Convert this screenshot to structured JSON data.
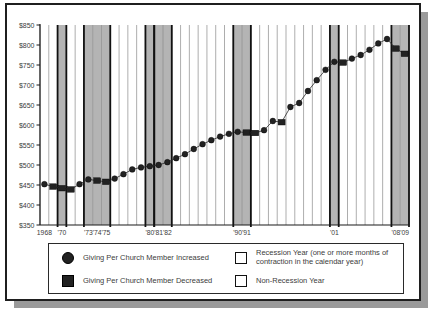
{
  "chart_data": {
    "type": "line",
    "title": "",
    "xlabel": "",
    "ylabel": "",
    "ylim": [
      350,
      850
    ],
    "ytick_step": 50,
    "ytick_prefix": "$",
    "grid": "vertical-year-bands",
    "legend_position": "bottom",
    "x": [
      1968,
      1969,
      1970,
      1971,
      1972,
      1973,
      1974,
      1975,
      1976,
      1977,
      1978,
      1979,
      1980,
      1981,
      1982,
      1983,
      1984,
      1985,
      1986,
      1987,
      1988,
      1989,
      1990,
      1991,
      1992,
      1993,
      1994,
      1995,
      1996,
      1997,
      1998,
      1999,
      2000,
      2001,
      2002,
      2003,
      2004,
      2005,
      2006,
      2007,
      2008,
      2009
    ],
    "series": [
      {
        "name": "Giving Per Church Member (dollars)",
        "values": [
          452,
          446,
          442,
          439,
          452,
          464,
          461,
          458,
          466,
          477,
          489,
          494,
          497,
          500,
          507,
          517,
          527,
          540,
          552,
          562,
          571,
          578,
          583,
          581,
          580,
          587,
          610,
          607,
          645,
          655,
          685,
          712,
          738,
          758,
          756,
          766,
          775,
          788,
          804,
          815,
          791,
          778
        ]
      }
    ],
    "decrease_years": [
      1969,
      1970,
      1971,
      1974,
      1975,
      1991,
      1992,
      1995,
      2002,
      2008,
      2009
    ],
    "recession_episodes": [
      [
        1970,
        1970
      ],
      [
        1973,
        1975
      ],
      [
        1980,
        1980
      ],
      [
        1981,
        1982
      ],
      [
        1990,
        1991
      ],
      [
        2001,
        2001
      ],
      [
        2008,
        2009
      ]
    ],
    "x_tick_labels": [
      {
        "year": 1968,
        "label": "1968"
      },
      {
        "year": 1970,
        "label": "'70"
      },
      {
        "year": 1973,
        "label": "'73"
      },
      {
        "year": 1974,
        "label": "'74"
      },
      {
        "year": 1975,
        "label": "'75"
      },
      {
        "year": 1980,
        "label": "'80"
      },
      {
        "year": 1981,
        "label": "'81"
      },
      {
        "year": 1982,
        "label": "'82"
      },
      {
        "year": 1990,
        "label": "'90"
      },
      {
        "year": 1991,
        "label": "'91"
      },
      {
        "year": 2001,
        "label": "'01"
      },
      {
        "year": 2008,
        "label": "'08"
      },
      {
        "year": 2009,
        "label": "'09"
      }
    ]
  },
  "legend": {
    "increased": "Giving Per Church Member Increased",
    "decreased": "Giving Per Church Member Decreased",
    "recession_line1": "Recession Year (one or more months of",
    "recession_line2": "contraction in the calendar year)",
    "non_recession": "Non-Recession Year"
  },
  "colors": {
    "recession_fill": "#b4b4b4",
    "non_recession_fill": "#ffffff",
    "marker": "#222222",
    "line": "#2a2a2a",
    "band_edge": "#111111",
    "year_line": "#8a8a8a",
    "axis": "#1a1a1a",
    "label_text": "#3c3c3c"
  }
}
